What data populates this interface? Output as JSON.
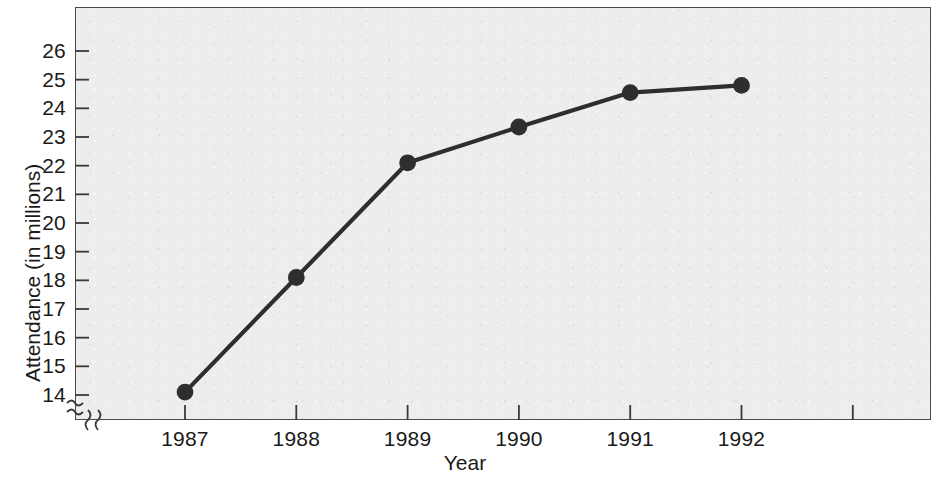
{
  "chart_data": {
    "type": "line",
    "title": "",
    "subtitle": "",
    "xlabel": "Year",
    "ylabel": "Attendance (in millions)",
    "categories": [
      "1987",
      "1988",
      "1989",
      "1990",
      "1991",
      "1992"
    ],
    "x": [
      1987,
      1988,
      1989,
      1990,
      1991,
      1992
    ],
    "values": [
      14.1,
      18.1,
      22.1,
      23.35,
      24.55,
      24.8
    ],
    "series": [
      {
        "name": "Attendance",
        "values": [
          14.1,
          18.1,
          22.1,
          23.35,
          24.55,
          24.8
        ]
      }
    ],
    "ylim": [
      13.5,
      26.5
    ],
    "yticks": [
      14,
      15,
      16,
      17,
      18,
      19,
      20,
      21,
      22,
      23,
      24,
      25,
      26
    ],
    "ytick_labels": [
      "14",
      "15",
      "16",
      "17",
      "18",
      "19",
      "20",
      "21",
      "22",
      "23",
      "24",
      "25",
      "26"
    ],
    "xtick_labels": [
      "1987",
      "1988",
      "1989",
      "1990",
      "1991",
      "1992"
    ],
    "grid": false,
    "legend": null,
    "legend_position": "none",
    "axis_break_y": true,
    "axis_break_x": true,
    "annotations": [],
    "marker": "filled-circle",
    "colors": {
      "line": "#2e2e2e",
      "marker": "#2e2e2e",
      "plot_background": "#ededed",
      "figure_background": "#ffffff",
      "axis": "#4a4a4a",
      "text": "#1a1a1a"
    }
  },
  "axis_titles": {
    "y": "Attendance (in millions)",
    "x": "Year"
  }
}
